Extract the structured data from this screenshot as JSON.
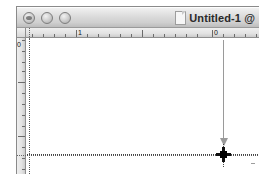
{
  "window": {
    "title": "Untitled-1 @",
    "doc_icon": "document-icon",
    "controls": {
      "close": "close-button",
      "minimize": "minimize-button",
      "zoom": "zoom-button"
    }
  },
  "rulers": {
    "horizontal": {
      "labels": [
        {
          "text": "1",
          "x": 50
        },
        {
          "text": "0",
          "x": 186
        }
      ],
      "major_ticks_x": [
        50,
        116,
        186
      ],
      "minor_ticks_x": [
        6,
        17,
        28,
        39,
        61,
        72,
        83,
        94,
        105,
        127,
        138,
        149,
        160,
        171,
        197,
        208,
        219,
        230
      ]
    },
    "vertical": {
      "labels": [
        {
          "text": "0",
          "y": 2
        }
      ],
      "major_ticks_y": [
        44,
        98
      ],
      "minor_ticks_y": [
        2,
        13,
        24,
        33,
        55,
        66,
        77,
        88,
        109,
        120,
        131
      ]
    }
  },
  "canvas": {
    "guides": {
      "horizontal": [
        {
          "y": 116
        }
      ],
      "vertical": [
        {
          "x": 2
        }
      ]
    },
    "drag_arrow": {
      "x": 196,
      "from_y": 33,
      "to_y": 140
    },
    "crosshair": {
      "x": 196,
      "y": 147,
      "label": "anchor-point"
    }
  }
}
